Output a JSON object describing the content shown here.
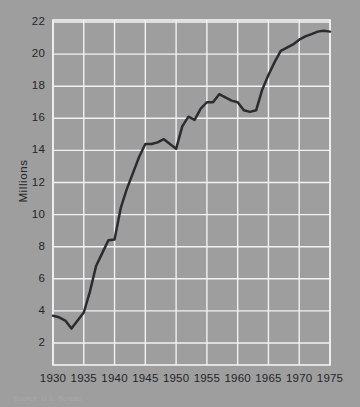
{
  "figure": {
    "background_color": "#9e9e9e",
    "plot_background_color": "#9e9e9e",
    "grid_color": "#f2f2f2",
    "line_color": "#2b2b30",
    "text_color": "#24242a"
  },
  "axis": {
    "y_title": "Millions",
    "y_ticks": [
      "22",
      "20",
      "18",
      "16",
      "14",
      "12",
      "10",
      "8",
      "6",
      "4",
      "2"
    ],
    "x_ticks": [
      "1930",
      "1935",
      "1940",
      "1945",
      "1950",
      "1955",
      "1960",
      "1965",
      "1970",
      "1975"
    ]
  },
  "source": {
    "note": "Source: U.S. Bureau"
  },
  "chart_data": {
    "type": "line",
    "title": "",
    "subtitle": "",
    "xlabel": "",
    "ylabel": "Millions",
    "xlim": [
      1930,
      1975
    ],
    "ylim": [
      1,
      22
    ],
    "grid": true,
    "legend": "none",
    "x_tick_interval": 5,
    "y_tick_interval": 2,
    "series": [
      {
        "name": "Millions",
        "x": [
          1930,
          1931,
          1932,
          1933,
          1934,
          1935,
          1936,
          1937,
          1938,
          1939,
          1940,
          1941,
          1942,
          1943,
          1944,
          1945,
          1946,
          1947,
          1948,
          1949,
          1950,
          1951,
          1952,
          1953,
          1954,
          1955,
          1956,
          1957,
          1958,
          1959,
          1960,
          1961,
          1962,
          1963,
          1964,
          1965,
          1966,
          1967,
          1968,
          1969,
          1970,
          1971,
          1972,
          1973,
          1974,
          1975
        ],
        "values": [
          3.7,
          3.6,
          3.4,
          2.9,
          3.4,
          3.9,
          5.2,
          6.8,
          7.6,
          8.4,
          8.45,
          10.4,
          11.6,
          12.6,
          13.6,
          14.4,
          14.4,
          14.5,
          14.7,
          14.4,
          14.1,
          15.5,
          16.1,
          15.9,
          16.6,
          17.0,
          17.0,
          17.5,
          17.3,
          17.1,
          17.0,
          16.5,
          16.4,
          16.5,
          17.8,
          18.7,
          19.5,
          20.2,
          20.4,
          20.6,
          20.9,
          21.1,
          21.25,
          21.4,
          21.45,
          21.4
        ]
      }
    ]
  },
  "geometry": {
    "plot_left": 53,
    "plot_right": 330,
    "plot_top": 20,
    "plot_bottom": 365,
    "y_pixel_at_22": 22,
    "y_pixel_at_2": 343
  }
}
